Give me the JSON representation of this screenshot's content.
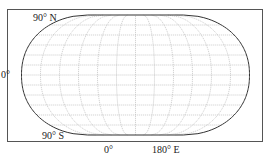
{
  "figure": {
    "projection": "flat-polar pseudo-cylindrical world map graticule",
    "labels": {
      "north_pole": "90° N",
      "south_pole": "90° S",
      "equator": "0°",
      "prime_meridian": "0°",
      "east_edge": "180° E"
    },
    "graticule": {
      "parallel_spacing_deg": 15,
      "meridian_spacing_deg": 30
    },
    "colors": {
      "frame": "#555555",
      "outline": "#333333",
      "grid": "#b0b0b0",
      "text": "#222222"
    },
    "caption": ""
  }
}
